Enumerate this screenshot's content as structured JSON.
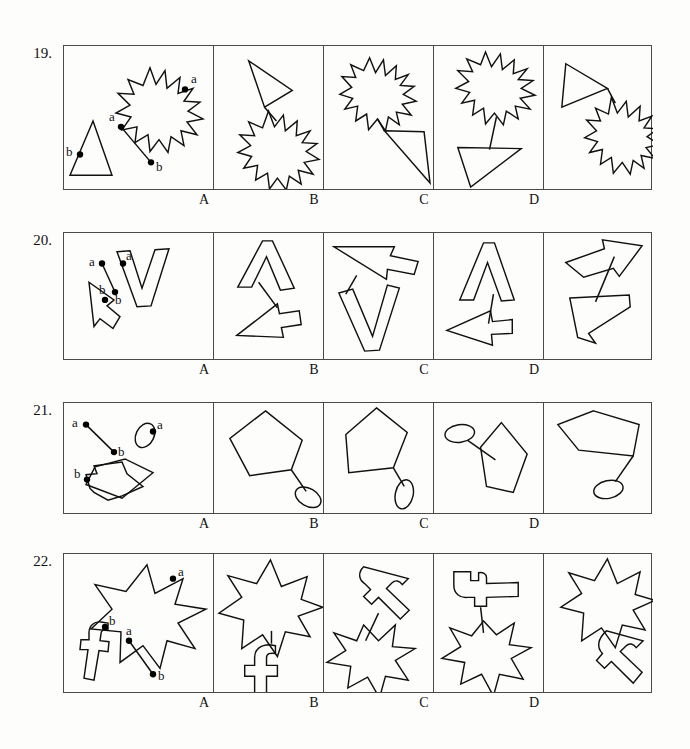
{
  "page": {
    "type": "spatial-reasoning-test",
    "background_color": "#fdfdfc",
    "ink_color": "#111111",
    "border_color": "#4a4a4a",
    "option_labels": [
      "A",
      "B",
      "C",
      "D"
    ],
    "point_labels": [
      "a",
      "b"
    ]
  },
  "layout": {
    "grid_left": 63,
    "grid_right": 652,
    "stimulus_width": 149,
    "option_width": 110,
    "rows": [
      {
        "top": 45,
        "height": 145,
        "label_y": 192
      },
      {
        "top": 232,
        "height": 128,
        "label_y": 362
      },
      {
        "top": 402,
        "height": 112,
        "label_y": 516
      },
      {
        "top": 553,
        "height": 140,
        "label_y": 695
      }
    ]
  },
  "questions": [
    {
      "number": "19.",
      "shape_names": [
        "triangle",
        "starburst-12-point"
      ],
      "stimulus": {
        "shape_a_name": "starburst-12-point",
        "shape_b_name": "triangle",
        "connector_label_start": "a",
        "connector_label_end": "b",
        "marker_on_shape_a": "a",
        "marker_on_shape_b": "b"
      },
      "options": [
        {
          "label": "A",
          "description": "triangle above starburst, joined"
        },
        {
          "label": "B",
          "description": "starburst upper-left, triangle lower-right, joined"
        },
        {
          "label": "C",
          "description": "starburst on top, connector stem, triangle below"
        },
        {
          "label": "D",
          "description": "triangle upper-left, starburst lower-right, joined"
        }
      ]
    },
    {
      "number": "20.",
      "shape_names": [
        "arrow",
        "letter-v-outline"
      ],
      "stimulus": {
        "shape_a_name": "letter-v-outline",
        "shape_b_name": "arrow",
        "connector_label_start": "a",
        "connector_label_end": "b",
        "marker_on_shape_a": "a",
        "marker_on_shape_b": "b"
      },
      "options": [
        {
          "label": "A",
          "description": "V rotated above, arrow pointing lower-left"
        },
        {
          "label": "B",
          "description": "arrow upper, V below vertical"
        },
        {
          "label": "C",
          "description": "V inverted above, arrow pointing left below"
        },
        {
          "label": "D",
          "description": "arrow upper-right, zigzag V lower"
        }
      ]
    },
    {
      "number": "21.",
      "shape_names": [
        "pentagon",
        "ellipse"
      ],
      "stimulus": {
        "shape_a_name": "ellipse",
        "shape_b_name": "pentagon",
        "connector_label_start": "a",
        "connector_label_end": "b",
        "marker_on_shape_a": "a",
        "marker_on_shape_b": "b"
      },
      "options": [
        {
          "label": "A",
          "description": "pentagon upper-left, ellipse lower-right"
        },
        {
          "label": "B",
          "description": "pentagon upper, ellipse lower-right small"
        },
        {
          "label": "C",
          "description": "ellipse upper-left, pentagon right"
        },
        {
          "label": "D",
          "description": "pentagon upper, ellipse below center"
        }
      ]
    },
    {
      "number": "22.",
      "shape_names": [
        "star-7-point",
        "letter-f-outline"
      ],
      "stimulus": {
        "shape_a_name": "star-7-point",
        "shape_b_name": "letter-f-outline",
        "connector_label_start": "a",
        "connector_label_end": "b",
        "marker_on_shape_a": "a",
        "marker_on_shape_b": "b"
      },
      "options": [
        {
          "label": "A",
          "description": "star on top, f-shape below"
        },
        {
          "label": "B",
          "description": "f-shape upper-right tilted, star lower-left"
        },
        {
          "label": "C",
          "description": "f-shape rotated on top, star below"
        },
        {
          "label": "D",
          "description": "star upper-left, f-shape lower-right tilted"
        }
      ]
    }
  ]
}
